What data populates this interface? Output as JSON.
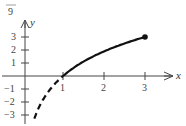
{
  "header": {
    "label": "9"
  },
  "chart_data": {
    "type": "line",
    "title": "",
    "xlabel": "x",
    "ylabel": "y",
    "xlim": [
      -0.55,
      3.7
    ],
    "ylim": [
      -3.6,
      4.2
    ],
    "x_ticks": [
      1,
      2,
      3
    ],
    "x_tick_labels": [
      "1",
      "2",
      "3"
    ],
    "y_ticks": [
      -3,
      -2,
      -1,
      1,
      2,
      3
    ],
    "y_tick_labels": [
      "−3",
      "−2",
      "−1",
      "1",
      "2",
      "3"
    ],
    "grid": false,
    "legend": null,
    "series": [
      {
        "name": "solid",
        "style": "solid",
        "x": [
          1,
          1.5,
          2,
          2.5,
          3
        ],
        "y": [
          0,
          1.1,
          1.9,
          2.5,
          3.0
        ],
        "endpoint_marker": {
          "x": 3,
          "y": 3,
          "filled": true
        }
      },
      {
        "name": "dashed",
        "style": "dashed",
        "x": [
          0.3,
          0.5,
          0.7,
          1
        ],
        "y": [
          -3.3,
          -1.9,
          -1.0,
          0
        ]
      }
    ],
    "annotations": []
  }
}
